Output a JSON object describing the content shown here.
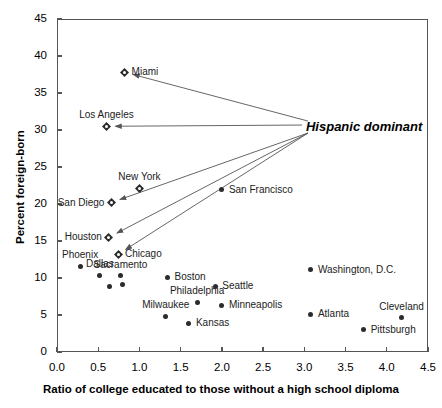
{
  "chart_data": {
    "type": "scatter",
    "title": "",
    "xlabel": "Ratio of college educated to those without a high school diploma",
    "ylabel": "Percent foreign-born",
    "xlim": [
      0.0,
      4.5
    ],
    "ylim": [
      0,
      45
    ],
    "xticks": [
      "0.0",
      "0.5",
      "1.0",
      "1.5",
      "2.0",
      "2.5",
      "3.0",
      "3.5",
      "4.0",
      "4.5"
    ],
    "yticks": [
      "0",
      "5",
      "10",
      "15",
      "20",
      "25",
      "30",
      "35",
      "40",
      "45"
    ],
    "grid": false,
    "legend": "none",
    "annotations": [
      {
        "text": "Hispanic dominant",
        "x": 3.02,
        "y": 30.4,
        "points_to": [
          "Miami",
          "Los Angeles",
          "San Diego",
          "Houston",
          "Chicago"
        ]
      }
    ],
    "marker_groups": [
      {
        "name": "Hispanic dominant",
        "marker": "open-diamond"
      },
      {
        "name": "Other",
        "marker": "filled-circle"
      }
    ],
    "points": [
      {
        "label": "Miami",
        "x": 0.82,
        "y": 37.8,
        "marker": "open-diamond",
        "label_pos": "right"
      },
      {
        "label": "Los Angeles",
        "x": 0.6,
        "y": 30.5,
        "marker": "open-diamond",
        "label_pos": "above"
      },
      {
        "label": "New York",
        "x": 1.0,
        "y": 22.1,
        "marker": "open-diamond",
        "label_pos": "above"
      },
      {
        "label": "San Francisco",
        "x": 2.0,
        "y": 21.9,
        "marker": "filled-circle",
        "label_pos": "right"
      },
      {
        "label": "San Diego",
        "x": 0.66,
        "y": 20.2,
        "marker": "open-diamond",
        "label_pos": "left"
      },
      {
        "label": "Houston",
        "x": 0.63,
        "y": 15.5,
        "marker": "open-diamond",
        "label_pos": "left"
      },
      {
        "label": "Chicago",
        "x": 0.74,
        "y": 13.2,
        "marker": "open-diamond",
        "label_pos": "right"
      },
      {
        "label": "Phoenix",
        "x": 0.28,
        "y": 11.6,
        "marker": "filled-circle",
        "label_pos": "above"
      },
      {
        "label": "Dallas",
        "x": 0.52,
        "y": 10.4,
        "marker": "filled-circle",
        "label_pos": "above"
      },
      {
        "label": "Sacramento",
        "x": 0.77,
        "y": 10.3,
        "marker": "filled-circle",
        "label_pos": "above"
      },
      {
        "label": "Boston",
        "x": 1.34,
        "y": 10.1,
        "marker": "filled-circle",
        "label_pos": "right"
      },
      {
        "label": "Seattle",
        "x": 1.92,
        "y": 8.9,
        "marker": "filled-circle",
        "label_pos": "right"
      },
      {
        "label": "Philadelphia",
        "x": 1.7,
        "y": 6.7,
        "marker": "filled-circle",
        "label_pos": "above"
      },
      {
        "label": "Minneapolis",
        "x": 2.0,
        "y": 6.3,
        "marker": "filled-circle",
        "label_pos": "right"
      },
      {
        "label": "Milwaukee",
        "x": 1.32,
        "y": 4.8,
        "marker": "filled-circle",
        "label_pos": "above"
      },
      {
        "label": "Kansas",
        "x": 1.6,
        "y": 3.9,
        "marker": "filled-circle",
        "label_pos": "right"
      },
      {
        "label": "Washington, D.C.",
        "x": 3.08,
        "y": 11.1,
        "marker": "filled-circle",
        "label_pos": "right"
      },
      {
        "label": "Atlanta",
        "x": 3.08,
        "y": 5.1,
        "marker": "filled-circle",
        "label_pos": "right"
      },
      {
        "label": "Cleveland",
        "x": 4.18,
        "y": 4.6,
        "marker": "filled-circle",
        "label_pos": "above"
      },
      {
        "label": "Pittsburgh",
        "x": 3.72,
        "y": 3.0,
        "marker": "filled-circle",
        "label_pos": "right"
      },
      {
        "label": "",
        "x": 0.64,
        "y": 8.9,
        "marker": "filled-circle",
        "label_pos": "none"
      },
      {
        "label": "",
        "x": 0.8,
        "y": 9.1,
        "marker": "filled-circle",
        "label_pos": "none"
      }
    ],
    "colors": {
      "axis": "#555555",
      "marker": "#2b2b2b",
      "label_text": "#222222",
      "annotation": "#000000",
      "background": "#ffffff"
    }
  }
}
